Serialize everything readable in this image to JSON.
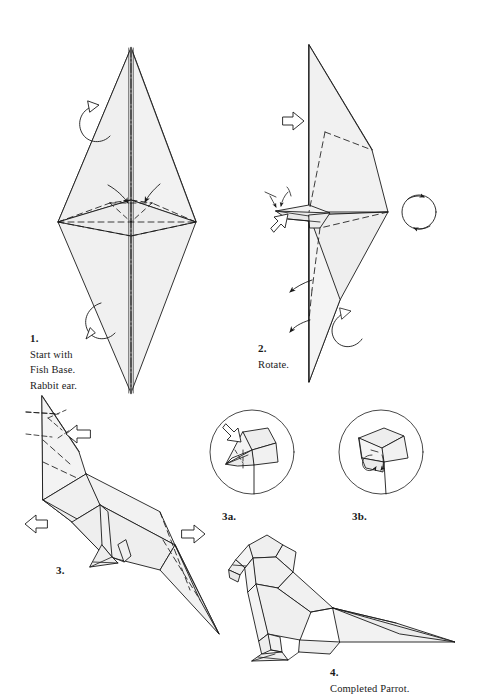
{
  "document": {
    "kind": "origami-instruction-plate",
    "model_name": "Parrot",
    "background_color": "#ffffff",
    "ink_color": "#1a1a1a",
    "paper_fill": "#f0f0f0",
    "paper_fill_dark": "#e2e2e2",
    "paper_fill_light": "#f7f7f7"
  },
  "steps": [
    {
      "id": "step-1",
      "number": "1.",
      "text": "Start with\nFish Base.\nRabbit ear.",
      "caption": "1. Start with Fish Base. Rabbit ear."
    },
    {
      "id": "step-2",
      "number": "2.",
      "text": "Rotate.",
      "caption": "2. Rotate."
    },
    {
      "id": "step-3",
      "number": "3.",
      "text": "",
      "caption": "3."
    },
    {
      "id": "step-3a",
      "number": "3a.",
      "text": "",
      "caption": "3a."
    },
    {
      "id": "step-3b",
      "number": "3b.",
      "text": "",
      "caption": "3b."
    },
    {
      "id": "step-4",
      "number": "4.",
      "text": "Completed Parrot.",
      "caption": "4. Completed Parrot."
    }
  ],
  "symbols": {
    "valley_fold": "dashed-line",
    "mountain_fold": "dash-dot-line",
    "fold_arrow": "solid-arrow",
    "push_arrow": "hollow-arrow",
    "turn_over_arrow": "loop-arrow",
    "rotate_arrow": "circular-arrow"
  }
}
